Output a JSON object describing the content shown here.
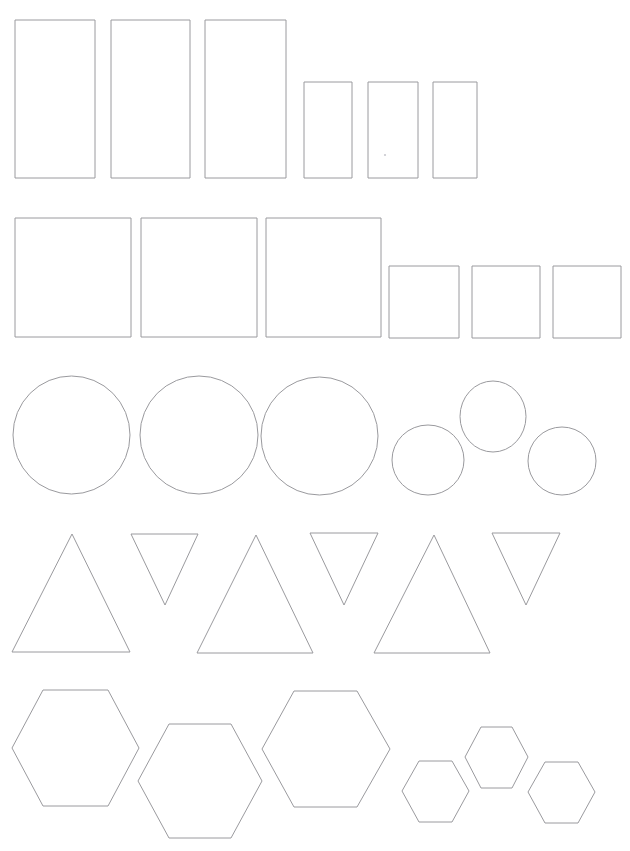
{
  "page": {
    "width": 630,
    "height": 851,
    "background_color": "#ffffff",
    "stroke_color": "#9a9a9e",
    "stroke_width": 1,
    "fill": "none"
  },
  "rows": [
    {
      "name": "rectangles-row",
      "label": "Rectangles",
      "shape_type": "rectangle",
      "count": 6,
      "shapes": [
        {
          "name": "rectangle-large-1",
          "type": "rect",
          "x": 15,
          "y": 20,
          "width": 80,
          "height": 158
        },
        {
          "name": "rectangle-large-2",
          "type": "rect",
          "x": 111,
          "y": 20,
          "width": 79,
          "height": 158
        },
        {
          "name": "rectangle-large-3",
          "type": "rect",
          "x": 205,
          "y": 20,
          "width": 81,
          "height": 158
        },
        {
          "name": "rectangle-small-1",
          "type": "rect",
          "x": 304,
          "y": 82,
          "width": 48,
          "height": 96
        },
        {
          "name": "rectangle-small-2",
          "type": "rect",
          "x": 368,
          "y": 82,
          "width": 50,
          "height": 96
        },
        {
          "name": "rectangle-small-3",
          "type": "rect",
          "x": 433,
          "y": 82,
          "width": 44,
          "height": 96
        }
      ]
    },
    {
      "name": "squares-row",
      "label": "Squares",
      "shape_type": "square",
      "count": 6,
      "shapes": [
        {
          "name": "square-large-1",
          "type": "rect",
          "x": 15,
          "y": 218,
          "width": 116,
          "height": 119
        },
        {
          "name": "square-large-2",
          "type": "rect",
          "x": 141,
          "y": 218,
          "width": 116,
          "height": 119
        },
        {
          "name": "square-large-3",
          "type": "rect",
          "x": 266,
          "y": 218,
          "width": 115,
          "height": 119
        },
        {
          "name": "square-small-1",
          "type": "rect",
          "x": 389,
          "y": 266,
          "width": 70,
          "height": 72
        },
        {
          "name": "square-small-2",
          "type": "rect",
          "x": 472,
          "y": 266,
          "width": 68,
          "height": 72
        },
        {
          "name": "square-small-3",
          "type": "rect",
          "x": 553,
          "y": 266,
          "width": 68,
          "height": 72
        }
      ]
    },
    {
      "name": "circles-row",
      "label": "Circles",
      "shape_type": "circle",
      "count": 6,
      "shapes": [
        {
          "name": "circle-large-1",
          "type": "ellipse",
          "cx": 71.5,
          "cy": 435,
          "rx": 58.5,
          "ry": 59
        },
        {
          "name": "circle-large-2",
          "type": "ellipse",
          "cx": 199,
          "cy": 435,
          "rx": 59,
          "ry": 59
        },
        {
          "name": "circle-large-3",
          "type": "ellipse",
          "cx": 319.5,
          "cy": 436,
          "rx": 58.5,
          "ry": 59
        },
        {
          "name": "circle-small-1",
          "type": "ellipse",
          "cx": 428,
          "cy": 460,
          "rx": 36,
          "ry": 35
        },
        {
          "name": "circle-small-2",
          "type": "ellipse",
          "cx": 493,
          "cy": 416.5,
          "rx": 33,
          "ry": 35.5
        },
        {
          "name": "circle-small-3",
          "type": "ellipse",
          "cx": 562,
          "cy": 461,
          "rx": 34,
          "ry": 34
        }
      ]
    },
    {
      "name": "triangles-row",
      "label": "Triangles",
      "shape_type": "triangle",
      "count": 6,
      "shapes": [
        {
          "name": "triangle-up-1",
          "type": "polygon",
          "orientation": "up",
          "points": "72,534 130,652 12,652"
        },
        {
          "name": "triangle-down-1",
          "type": "polygon",
          "orientation": "down",
          "points": "131,534 198,534 165,605"
        },
        {
          "name": "triangle-up-2",
          "type": "polygon",
          "orientation": "up",
          "points": "256,535 313,653 197,653"
        },
        {
          "name": "triangle-down-2",
          "type": "polygon",
          "orientation": "down",
          "points": "310,533 378,533 344,605"
        },
        {
          "name": "triangle-up-3",
          "type": "polygon",
          "orientation": "up",
          "points": "434,535 490,653 374,653"
        },
        {
          "name": "triangle-down-3",
          "type": "polygon",
          "orientation": "down",
          "points": "492,533 560,533 526,605"
        }
      ]
    },
    {
      "name": "hexagons-row",
      "label": "Hexagons",
      "shape_type": "hexagon",
      "count": 6,
      "shapes": [
        {
          "name": "hexagon-large-1",
          "type": "polygon",
          "points": "43,690 108,690 139,748 108,806 43,806 12,748"
        },
        {
          "name": "hexagon-large-2",
          "type": "polygon",
          "points": "169,724 231,724 262,781 231,838 169,838 138,781"
        },
        {
          "name": "hexagon-large-3",
          "type": "polygon",
          "points": "294,691 357,691 390,749 357,807 294,807 262,749"
        },
        {
          "name": "hexagon-small-1",
          "type": "polygon",
          "points": "419,761 452,761 469,791 452,822 419,822 402,791"
        },
        {
          "name": "hexagon-small-2",
          "type": "polygon",
          "points": "481,727 512,727 528,757 512,788 481,788 465,757"
        },
        {
          "name": "hexagon-small-3",
          "type": "polygon",
          "points": "545,762 578,762 595,792 578,823 545,823 528,792"
        }
      ]
    }
  ],
  "artifacts": [
    {
      "name": "scan-speck-1",
      "x": 385,
      "y": 155,
      "r": 1.1
    }
  ]
}
